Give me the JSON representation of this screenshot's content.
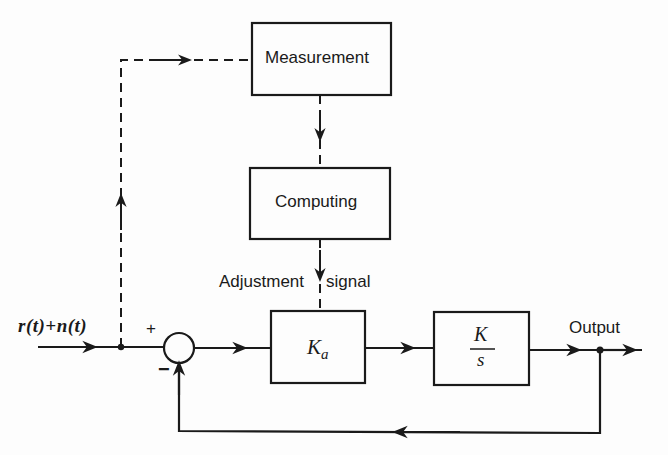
{
  "diagram": {
    "type": "block-diagram",
    "blocks": [
      {
        "id": "measurement",
        "label": "Measurement"
      },
      {
        "id": "computing",
        "label": "Computing"
      },
      {
        "id": "amplifier",
        "label": "Ka",
        "label_main": "K",
        "label_sub": "a"
      },
      {
        "id": "plant",
        "label": "K/s",
        "numerator": "K",
        "denominator": "s"
      }
    ],
    "summing_junction": {
      "plus_sign": "+",
      "minus_sign": "−"
    },
    "labels": {
      "input": "r(t)+n(t)",
      "adjustment": "Adjustment",
      "signal": "signal",
      "output": "Output"
    },
    "edges": [
      {
        "from": "input",
        "to": "summing_junction",
        "style": "solid"
      },
      {
        "from": "input",
        "to": "measurement",
        "style": "dashed"
      },
      {
        "from": "measurement",
        "to": "computing",
        "style": "dashed"
      },
      {
        "from": "computing",
        "to": "amplifier",
        "style": "dashed",
        "label": "Adjustment signal"
      },
      {
        "from": "summing_junction",
        "to": "amplifier",
        "style": "solid"
      },
      {
        "from": "amplifier",
        "to": "plant",
        "style": "solid"
      },
      {
        "from": "plant",
        "to": "output",
        "style": "solid"
      },
      {
        "from": "output",
        "to": "summing_junction",
        "style": "solid",
        "sign": "-"
      }
    ]
  }
}
